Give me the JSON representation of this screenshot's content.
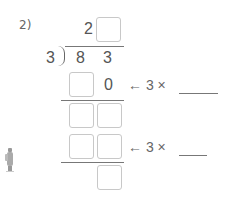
{
  "problem": {
    "label": "2)",
    "divisor": "3",
    "dividend_digits": [
      "8",
      "3"
    ],
    "quotient_known_digit": "2",
    "step1_partial_digit": "0",
    "step1_hint": "← 3 ×",
    "step2_hint": "← 3 ×"
  }
}
